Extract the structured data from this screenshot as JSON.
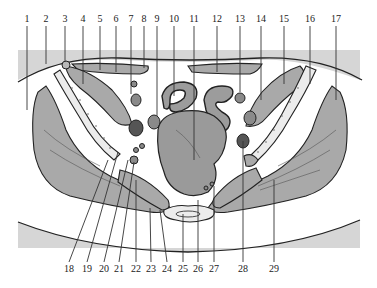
{
  "figure": {
    "colors": {
      "skin_band": "#d6d6d6",
      "muscle": "#a9a9a9",
      "organ": "#9a9a9a",
      "vessel": "#8a8a8a",
      "vessel_dark": "#555555",
      "bone": "#ececec",
      "fat": "#ffffff",
      "line": "#222222"
    },
    "top_labels": [
      {
        "n": "1",
        "x": 27
      },
      {
        "n": "2",
        "x": 46
      },
      {
        "n": "3",
        "x": 65
      },
      {
        "n": "4",
        "x": 83
      },
      {
        "n": "5",
        "x": 100
      },
      {
        "n": "6",
        "x": 116
      },
      {
        "n": "7",
        "x": 131
      },
      {
        "n": "8",
        "x": 144
      },
      {
        "n": "9",
        "x": 157
      },
      {
        "n": "10",
        "x": 174
      },
      {
        "n": "11",
        "x": 194
      },
      {
        "n": "12",
        "x": 217
      },
      {
        "n": "13",
        "x": 240
      },
      {
        "n": "14",
        "x": 261
      },
      {
        "n": "15",
        "x": 284
      },
      {
        "n": "16",
        "x": 310
      },
      {
        "n": "17",
        "x": 336
      }
    ],
    "bottom_labels": [
      {
        "n": "18",
        "x": 69
      },
      {
        "n": "19",
        "x": 87
      },
      {
        "n": "20",
        "x": 104
      },
      {
        "n": "21",
        "x": 119
      },
      {
        "n": "22",
        "x": 136
      },
      {
        "n": "23",
        "x": 151
      },
      {
        "n": "24",
        "x": 167
      },
      {
        "n": "25",
        "x": 183
      },
      {
        "n": "26",
        "x": 198
      },
      {
        "n": "27",
        "x": 214
      },
      {
        "n": "28",
        "x": 243
      },
      {
        "n": "29",
        "x": 274
      }
    ]
  }
}
